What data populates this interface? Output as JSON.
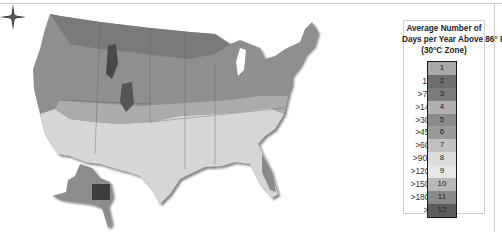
{
  "legend": {
    "title_line1": "Average Number of",
    "title_line2": "Days per Year Above 86° F",
    "title_line3": "(30°C Zone)",
    "zones": [
      {
        "range": "<1",
        "zone": "1",
        "color": "#a9a9a9"
      },
      {
        "range": "1 to 7",
        "zone": "2",
        "color": "#6e6e6e"
      },
      {
        "range": ">7 to 14",
        "zone": "3",
        "color": "#7b7b7b"
      },
      {
        "range": ">14 to 30",
        "zone": "4",
        "color": "#b0b0b0"
      },
      {
        "range": ">30 to 45",
        "zone": "5",
        "color": "#8c8c8c"
      },
      {
        "range": ">45 to 60",
        "zone": "6",
        "color": "#9a9a9a"
      },
      {
        "range": ">60 to 90",
        "zone": "7",
        "color": "#c2c2c2"
      },
      {
        "range": ">90 to 120",
        "zone": "8",
        "color": "#dcdcdc"
      },
      {
        "range": ">120 to 150",
        "zone": "9",
        "color": "#e6e6e6"
      },
      {
        "range": ">150 to 180",
        "zone": "10",
        "color": "#b8b8b8"
      },
      {
        "range": ">180 to 210",
        "zone": "11",
        "color": "#8a8a8a"
      },
      {
        "range": ">210",
        "zone": "12",
        "color": "#5c5c5c"
      }
    ]
  },
  "map": {
    "subject": "United States heat zone map",
    "compass_icon": "compass-rose-icon"
  }
}
